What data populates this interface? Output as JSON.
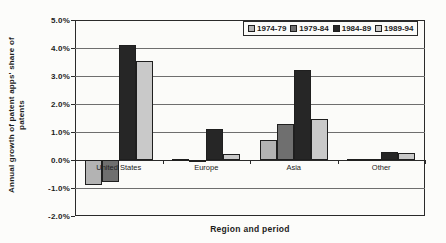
{
  "chart_data": {
    "type": "bar",
    "title": "",
    "xlabel": "Region and period",
    "ylabel": "Annual growth of patent apps' share of patents",
    "ylabel_lines": [
      "Annual growth of patent apps' share of",
      "patents"
    ],
    "categories": [
      "United States",
      "Europe",
      "Asia",
      "Other"
    ],
    "series": [
      {
        "name": "1974-79",
        "color": "#b3b3b3",
        "values": [
          -0.9,
          0.03,
          0.7,
          0.05
        ]
      },
      {
        "name": "1979-84",
        "color": "#6f6f6f",
        "values": [
          -0.8,
          -0.07,
          1.3,
          0.02
        ]
      },
      {
        "name": "1984-89",
        "color": "#262626",
        "values": [
          4.1,
          1.1,
          3.2,
          0.3
        ]
      },
      {
        "name": "1989-94",
        "color": "#c9c9c9",
        "values": [
          3.55,
          0.2,
          1.45,
          0.25
        ]
      }
    ],
    "ylim": [
      -2,
      5
    ],
    "ytick_step": 1,
    "ytick_labels": [
      "5.0%",
      "4.0%",
      "3.0%",
      "2.0%",
      "1.0%",
      "0.0%",
      "-1.0%",
      "-2.0%"
    ],
    "grid": true,
    "legend_position": "top-right",
    "colors": {
      "gridline": "#6e6e6e",
      "axis": "#2a2a2a",
      "plot_background": "#fbfbf9"
    }
  }
}
